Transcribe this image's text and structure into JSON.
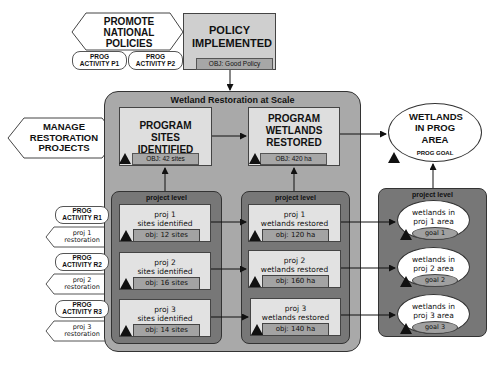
{
  "top": {
    "promote": {
      "label": "PROMOTE NATIONAL POLICIES"
    },
    "activities": [
      {
        "label": "PROG ACTIVITY P1"
      },
      {
        "label": "PROG ACTIVITY P2"
      }
    ],
    "policy": {
      "title": "POLICY IMPLEMENTED",
      "obj": "OBJ: Good Policy"
    }
  },
  "manage": {
    "label": "MANAGE RESTORATION PROJECTS"
  },
  "container": {
    "title": "Wetland Restoration at Scale",
    "sites": {
      "title": "PROGRAM SITES IDENTIFIED",
      "obj": "OBJ: 42 sites"
    },
    "wetlands": {
      "title": "PROGRAM WETLANDS RESTORED",
      "obj": "OBJ: 420 ha"
    }
  },
  "goal": {
    "title": "WETLANDS IN PROG AREA",
    "subtitle": "PROG GOAL"
  },
  "project_level_label": "project level",
  "left_activities": [
    {
      "activity": "PROG ACTIVITY R1",
      "restoration": "proj 1 restoration"
    },
    {
      "activity": "PROG ACTIVITY R2",
      "restoration": "proj 2 restoration"
    },
    {
      "activity": "PROG ACTIVITY R3",
      "restoration": "proj 3 restoration"
    }
  ],
  "sites_projects": [
    {
      "name": "proj 1",
      "desc": "sites identified",
      "obj": "obj: 12 sites"
    },
    {
      "name": "proj 2",
      "desc": "sites identified",
      "obj": "obj: 16 sites"
    },
    {
      "name": "proj 3",
      "desc": "sites identified",
      "obj": "obj: 14 sites"
    }
  ],
  "wetland_projects": [
    {
      "name": "proj 1",
      "desc": "wetlands restored",
      "obj": "obj: 120 ha"
    },
    {
      "name": "proj 2",
      "desc": "wetlands restored",
      "obj": "obj: 160 ha"
    },
    {
      "name": "proj 3",
      "desc": "wetlands restored",
      "obj": "obj: 140 ha"
    }
  ],
  "goal_projects": [
    {
      "text": "wetlands in proj 1 area",
      "goal": "goal 1"
    },
    {
      "text": "wetlands in proj 2 area",
      "goal": "goal 2"
    },
    {
      "text": "wetlands in proj 3 area",
      "goal": "goal 3"
    }
  ]
}
